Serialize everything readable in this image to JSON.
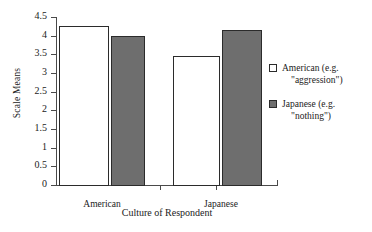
{
  "chart_data": {
    "type": "bar",
    "title": "",
    "xlabel": "Culture of Respondent",
    "ylabel": "Scale Means",
    "categories": [
      "American",
      "Japanese"
    ],
    "series": [
      {
        "name": "American (e.g. \"aggression\")",
        "values": [
          4.25,
          3.47
        ],
        "color": "#ffffff"
      },
      {
        "name": "Japanese (e.g. \"nothing\")",
        "values": [
          3.98,
          4.15
        ],
        "color": "#6e6e6e"
      }
    ],
    "ylim": [
      0,
      4.5
    ],
    "ytick_labels": [
      "4.5",
      "4",
      "3.5",
      "3",
      "2.5",
      "2",
      "1.5",
      "1",
      "0.5",
      "0"
    ],
    "ytick_values": [
      4.5,
      4,
      3.5,
      3,
      2.5,
      2,
      1.5,
      1,
      0.5,
      0
    ],
    "grid": false,
    "legend_position": "right"
  },
  "legend": {
    "items": [
      {
        "line1": "American (e.g.",
        "line2": "\"aggression\")",
        "swatch": "white-square-icon"
      },
      {
        "line1": "Japanese (e.g.",
        "line2": "\"nothing\")",
        "swatch": "gray-square-icon"
      }
    ]
  },
  "axes": {
    "y_title": "Scale Means",
    "x_title": "Culture of Respondent",
    "y_ticks": [
      "4.5",
      "4",
      "3.5",
      "3",
      "2.5",
      "2",
      "1.5",
      "1",
      "0.5",
      "0"
    ],
    "x_ticks": [
      "American",
      "Japanese"
    ]
  },
  "colors": {
    "bar_fill_gray": "#6e6e6e",
    "bar_fill_white": "#ffffff",
    "bar_outline": "#2b2b2b",
    "axis": "#4a4a4a",
    "text": "#222222"
  }
}
